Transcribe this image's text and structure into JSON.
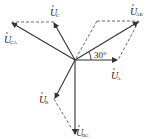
{
  "diagram": {
    "type": "phasor-diagram",
    "colors": {
      "line": "#333333",
      "text": "#222222",
      "background": "#ffffff"
    },
    "phasors": [
      {
        "name": "U_A",
        "symbol": "U",
        "subscript": "A",
        "role": "phase-voltage"
      },
      {
        "name": "U_B",
        "symbol": "U",
        "subscript": "B",
        "role": "phase-voltage"
      },
      {
        "name": "U_C",
        "symbol": "U",
        "subscript": "C",
        "role": "phase-voltage"
      },
      {
        "name": "U_AB",
        "symbol": "U",
        "subscript": "AB",
        "role": "line-voltage"
      },
      {
        "name": "U_BC",
        "symbol": "U",
        "subscript": "BC",
        "role": "line-voltage"
      },
      {
        "name": "U_CA",
        "symbol": "U",
        "subscript": "CA",
        "role": "line-voltage"
      }
    ],
    "angle_label": "30°"
  }
}
